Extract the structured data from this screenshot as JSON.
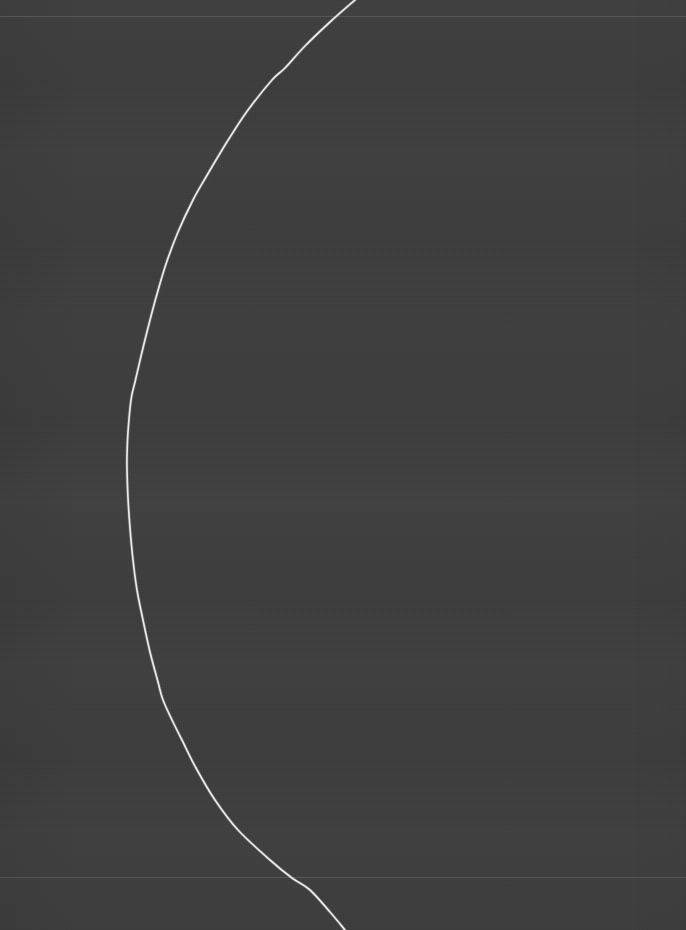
{
  "canvas": {
    "width": 686,
    "height": 930,
    "background_color": "#3d3d3d",
    "description": "Dark plot panel with a single light curve and two faint horizontal gridlines"
  },
  "chart_data": {
    "type": "line",
    "title": "",
    "subtitle": "",
    "xlabel": "",
    "ylabel": "",
    "legend": [],
    "legend_position": "none",
    "grid": true,
    "xlim": [
      0,
      686
    ],
    "ylim": [
      930,
      0
    ],
    "tick_labels_x": [],
    "tick_labels_y": [],
    "annotations": [],
    "gridlines": {
      "orientation": "horizontal",
      "color": "#6b6b6b",
      "width": 1,
      "y_positions": [
        16,
        877
      ]
    },
    "series": [
      {
        "name": "curve-1",
        "color": "#f2f2f2",
        "width": 1.7,
        "style": "solid",
        "points": [
          [
            355,
            0
          ],
          [
            330,
            22
          ],
          [
            305,
            46
          ],
          [
            285,
            68
          ],
          [
            272,
            80
          ],
          [
            248,
            110
          ],
          [
            232,
            134
          ],
          [
            222,
            150
          ],
          [
            206,
            177
          ],
          [
            193,
            200
          ],
          [
            178,
            232
          ],
          [
            166,
            264
          ],
          [
            157,
            294
          ],
          [
            150,
            320
          ],
          [
            142,
            352
          ],
          [
            135,
            382
          ],
          [
            131,
            400
          ],
          [
            128,
            432
          ],
          [
            127,
            455
          ],
          [
            127,
            470
          ],
          [
            128,
            498
          ],
          [
            130,
            528
          ],
          [
            133,
            560
          ],
          [
            137,
            590
          ],
          [
            143,
            620
          ],
          [
            150,
            652
          ],
          [
            158,
            682
          ],
          [
            163,
            700
          ],
          [
            173,
            722
          ],
          [
            182,
            740
          ],
          [
            196,
            768
          ],
          [
            215,
            800
          ],
          [
            238,
            830
          ],
          [
            270,
            860
          ],
          [
            292,
            878
          ],
          [
            310,
            890
          ],
          [
            330,
            912
          ],
          [
            345,
            930
          ]
        ]
      }
    ]
  },
  "colors": {
    "background": "#3d3d3d",
    "curve": "#f2f2f2",
    "gridline": "#6b6b6b"
  }
}
